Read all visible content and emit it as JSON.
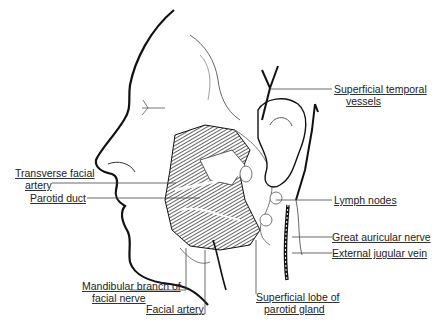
{
  "diagram": {
    "labels": {
      "superficial_temporal_1": "Superficial temporal",
      "superficial_temporal_2": "vessels",
      "transverse_facial_1": "Transverse facial",
      "transverse_facial_2": "artery",
      "parotid_duct": "Parotid duct",
      "lymph_nodes": "Lymph nodes",
      "great_auricular": "Great auricular nerve",
      "external_jugular": "External jugular vein",
      "mandibular_branch_1": "Mandibular branch of",
      "mandibular_branch_2": "facial nerve",
      "facial_artery": "Facial artery",
      "superficial_lobe_1": "Superficial lobe of",
      "superficial_lobe_2": "parotid gland"
    },
    "colors": {
      "ink": "#111111",
      "leader": "#444444",
      "hatch": "#333333"
    }
  }
}
